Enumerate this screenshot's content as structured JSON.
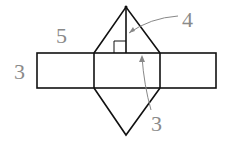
{
  "diagram": {
    "type": "net of triangular prism",
    "labels": {
      "slant_side": "5",
      "rect_height": "3",
      "triangle_height": "4",
      "base": "3"
    },
    "colors": {
      "line": "#111111",
      "label": "#8a8a8a"
    }
  }
}
